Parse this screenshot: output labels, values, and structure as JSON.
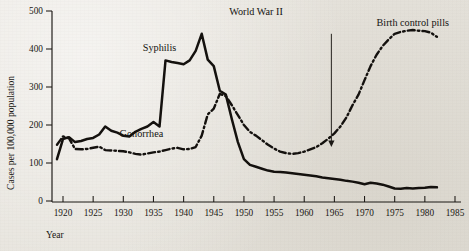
{
  "chart_data": {
    "type": "line",
    "title": "",
    "xlabel": "Year",
    "ylabel": "Cases per 100,000 population",
    "xlim": [
      1918,
      1985
    ],
    "ylim": [
      0,
      500
    ],
    "grid": false,
    "legend_position": "inline-labels",
    "xticks": [
      1920,
      1925,
      1930,
      1935,
      1940,
      1945,
      1950,
      1955,
      1960,
      1965,
      1970,
      1975,
      1980,
      1985
    ],
    "yticks": [
      0,
      100,
      200,
      300,
      400,
      500
    ],
    "series": [
      {
        "name": "Syphilis",
        "style": "solid",
        "label_x": 1936,
        "label_y": 395,
        "x": [
          1919,
          1920,
          1921,
          1922,
          1923,
          1924,
          1925,
          1926,
          1927,
          1928,
          1929,
          1930,
          1931,
          1932,
          1933,
          1934,
          1935,
          1936,
          1937,
          1938,
          1939,
          1940,
          1941,
          1942,
          1943,
          1944,
          1945,
          1946,
          1947,
          1948,
          1949,
          1950,
          1951,
          1952,
          1953,
          1954,
          1955,
          1956,
          1957,
          1958,
          1959,
          1960,
          1961,
          1962,
          1963,
          1964,
          1965,
          1966,
          1967,
          1968,
          1969,
          1970,
          1971,
          1972,
          1973,
          1974,
          1975,
          1976,
          1977,
          1978,
          1979,
          1980,
          1981,
          1982
        ],
        "values": [
          110,
          163,
          168,
          155,
          158,
          163,
          166,
          175,
          196,
          185,
          180,
          172,
          170,
          182,
          190,
          196,
          208,
          196,
          370,
          366,
          363,
          360,
          370,
          395,
          440,
          372,
          355,
          290,
          280,
          215,
          155,
          110,
          95,
          90,
          85,
          80,
          77,
          76,
          75,
          73,
          71,
          69,
          67,
          65,
          62,
          60,
          58,
          56,
          53,
          51,
          48,
          44,
          48,
          46,
          43,
          38,
          33,
          32,
          34,
          33,
          34,
          35,
          37,
          36
        ]
      },
      {
        "name": "Gonorrhea",
        "style": "dash-dot",
        "label_x": 1933,
        "label_y": 168,
        "x": [
          1919,
          1920,
          1921,
          1922,
          1923,
          1924,
          1925,
          1926,
          1927,
          1928,
          1929,
          1930,
          1931,
          1932,
          1933,
          1934,
          1935,
          1936,
          1937,
          1938,
          1939,
          1940,
          1941,
          1942,
          1943,
          1944,
          1945,
          1946,
          1947,
          1948,
          1949,
          1950,
          1951,
          1952,
          1953,
          1954,
          1955,
          1956,
          1957,
          1958,
          1959,
          1960,
          1961,
          1962,
          1963,
          1964,
          1965,
          1966,
          1967,
          1968,
          1969,
          1970,
          1971,
          1972,
          1973,
          1974,
          1975,
          1976,
          1977,
          1978,
          1979,
          1980,
          1981,
          1982
        ],
        "values": [
          148,
          170,
          165,
          137,
          136,
          137,
          140,
          143,
          134,
          133,
          132,
          131,
          128,
          124,
          122,
          125,
          128,
          130,
          134,
          138,
          140,
          136,
          137,
          142,
          172,
          228,
          243,
          282,
          276,
          252,
          226,
          200,
          182,
          172,
          160,
          148,
          138,
          130,
          126,
          124,
          126,
          130,
          136,
          142,
          152,
          164,
          178,
          196,
          220,
          252,
          280,
          318,
          355,
          385,
          408,
          425,
          440,
          445,
          448,
          450,
          448,
          447,
          443,
          432
        ]
      }
    ],
    "annotations": [
      {
        "name": "world-war-ii",
        "text": "World War II",
        "label_x": 1952,
        "label_y": 490,
        "has_arrow": false
      },
      {
        "name": "birth-control-pills",
        "text": "Birth control pills",
        "label_x": 1978,
        "label_y": 460,
        "has_arrow": true,
        "arrow_x": 1964.5,
        "arrow_y_top": 440,
        "arrow_y_bottom": 145
      }
    ]
  },
  "axes": {
    "y_label": "Cases per 100,000 population",
    "x_label": "Year",
    "y_tick_labels": [
      "0",
      "100",
      "200",
      "300",
      "400",
      "500"
    ],
    "x_tick_labels": [
      "1920",
      "1925",
      "1930",
      "1935",
      "1940",
      "1945",
      "1950",
      "1955",
      "1960",
      "1965",
      "1970",
      "1975",
      "1980",
      "1985"
    ]
  },
  "labels": {
    "syphilis": "Syphilis",
    "gonorrhea": "Gonorrhea",
    "world_war_ii": "World War II",
    "birth_control_pills": "Birth control pills"
  },
  "colors": {
    "ink": "#14110e",
    "paper": "#e9e6e0"
  }
}
